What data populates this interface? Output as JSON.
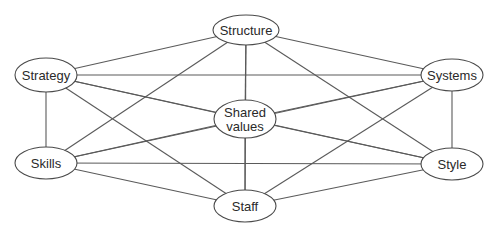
{
  "diagram": {
    "colors": {
      "edge": "#5a5a5a",
      "node_stroke": "#4a4a4a",
      "node_fill": "#ffffff",
      "text": "#2a2a2a",
      "background": "#ffffff"
    },
    "nodes": [
      {
        "id": "structure",
        "label": "Structure",
        "lines": [
          "Structure"
        ],
        "cx": 246,
        "cy": 30,
        "rx": 33,
        "ry": 15
      },
      {
        "id": "strategy",
        "label": "Strategy",
        "lines": [
          "Strategy"
        ],
        "cx": 46,
        "cy": 75,
        "rx": 31,
        "ry": 17
      },
      {
        "id": "systems",
        "label": "Systems",
        "lines": [
          "Systems"
        ],
        "cx": 452,
        "cy": 75,
        "rx": 31,
        "ry": 16
      },
      {
        "id": "shared_values",
        "label": "Shared values",
        "lines": [
          "Shared",
          "values"
        ],
        "cx": 245,
        "cy": 119,
        "rx": 31,
        "ry": 19
      },
      {
        "id": "skills",
        "label": "Skills",
        "lines": [
          "Skills"
        ],
        "cx": 46,
        "cy": 163,
        "rx": 31,
        "ry": 16
      },
      {
        "id": "style",
        "label": "Style",
        "lines": [
          "Style"
        ],
        "cx": 452,
        "cy": 164,
        "rx": 31,
        "ry": 16
      },
      {
        "id": "staff",
        "label": "Staff",
        "lines": [
          "Staff"
        ],
        "cx": 245,
        "cy": 206,
        "rx": 31,
        "ry": 16
      }
    ],
    "edges": [
      [
        "structure",
        "strategy"
      ],
      [
        "structure",
        "systems"
      ],
      [
        "structure",
        "shared_values"
      ],
      [
        "structure",
        "skills"
      ],
      [
        "structure",
        "style"
      ],
      [
        "structure",
        "staff"
      ],
      [
        "strategy",
        "systems"
      ],
      [
        "strategy",
        "shared_values"
      ],
      [
        "strategy",
        "skills"
      ],
      [
        "strategy",
        "style"
      ],
      [
        "strategy",
        "staff"
      ],
      [
        "systems",
        "shared_values"
      ],
      [
        "systems",
        "skills"
      ],
      [
        "systems",
        "style"
      ],
      [
        "systems",
        "staff"
      ],
      [
        "shared_values",
        "skills"
      ],
      [
        "shared_values",
        "style"
      ],
      [
        "shared_values",
        "staff"
      ],
      [
        "skills",
        "style"
      ],
      [
        "skills",
        "staff"
      ],
      [
        "style",
        "staff"
      ]
    ]
  }
}
